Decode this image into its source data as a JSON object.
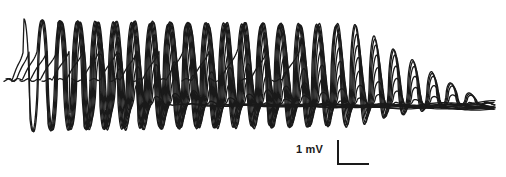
{
  "figure": {
    "type": "electrophysiology-trace-overlay",
    "background_color": "#ffffff",
    "trace_color": "#1a1a1a",
    "width": 506,
    "height": 177
  },
  "scale_bar": {
    "label": "1 mV",
    "vertical_value": 1,
    "vertical_unit": "mV",
    "x": 337,
    "y": 140,
    "vertical_length_px": 25,
    "horizontal_length_px": 32,
    "color": "#1a1a1a"
  },
  "chart_data": {
    "type": "line",
    "title": "",
    "subtitle": "",
    "xlabel": "",
    "ylabel": "",
    "grid": false,
    "legend": false,
    "axes_visible": false,
    "xlim": [
      0,
      506
    ],
    "ylim_pixels": [
      0,
      177
    ],
    "oscillation": {
      "period_px": 19.2,
      "peak_y_px": 20,
      "trough_y_px": 131,
      "baseline_y_px": 80,
      "bundle_y_px": 105,
      "cycles_visible": 18
    },
    "series": [
      {
        "name": "sweep-1",
        "onset_x": 12,
        "burst_start_x": 24,
        "burst_end_x": 60,
        "decay_end_x": 172,
        "amplitude": 1.0,
        "phase": 0.0
      },
      {
        "name": "sweep-2",
        "onset_x": 16,
        "burst_start_x": 30,
        "burst_end_x": 78,
        "decay_end_x": 196,
        "amplitude": 0.99,
        "phase": 0.32
      },
      {
        "name": "sweep-3",
        "onset_x": 22,
        "burst_start_x": 38,
        "burst_end_x": 96,
        "decay_end_x": 220,
        "amplitude": 0.98,
        "phase": 0.64
      },
      {
        "name": "sweep-4",
        "onset_x": 30,
        "burst_start_x": 48,
        "burst_end_x": 116,
        "decay_end_x": 246,
        "amplitude": 0.97,
        "phase": 0.96
      },
      {
        "name": "sweep-5",
        "onset_x": 40,
        "burst_start_x": 58,
        "burst_end_x": 136,
        "decay_end_x": 272,
        "amplitude": 0.97,
        "phase": 1.28
      },
      {
        "name": "sweep-6",
        "onset_x": 52,
        "burst_start_x": 70,
        "burst_end_x": 158,
        "decay_end_x": 300,
        "amplitude": 0.96,
        "phase": 1.6
      },
      {
        "name": "sweep-7",
        "onset_x": 66,
        "burst_start_x": 84,
        "burst_end_x": 180,
        "decay_end_x": 326,
        "amplitude": 0.96,
        "phase": 1.92
      },
      {
        "name": "sweep-8",
        "onset_x": 82,
        "burst_start_x": 100,
        "burst_end_x": 202,
        "decay_end_x": 352,
        "amplitude": 0.95,
        "phase": 2.24
      },
      {
        "name": "sweep-9",
        "onset_x": 100,
        "burst_start_x": 118,
        "burst_end_x": 226,
        "decay_end_x": 378,
        "amplitude": 0.95,
        "phase": 2.56
      },
      {
        "name": "sweep-10",
        "onset_x": 120,
        "burst_start_x": 138,
        "burst_end_x": 250,
        "decay_end_x": 404,
        "amplitude": 0.94,
        "phase": 2.88
      },
      {
        "name": "sweep-11",
        "onset_x": 142,
        "burst_start_x": 160,
        "burst_end_x": 274,
        "decay_end_x": 430,
        "amplitude": 0.94,
        "phase": 3.2
      },
      {
        "name": "sweep-12",
        "onset_x": 166,
        "burst_start_x": 184,
        "burst_end_x": 298,
        "decay_end_x": 456,
        "amplitude": 0.93,
        "phase": 3.52
      },
      {
        "name": "sweep-13",
        "onset_x": 192,
        "burst_start_x": 210,
        "burst_end_x": 320,
        "decay_end_x": 478,
        "amplitude": 0.93,
        "phase": 3.84
      },
      {
        "name": "sweep-14",
        "onset_x": 220,
        "burst_start_x": 238,
        "burst_end_x": 340,
        "decay_end_x": 495,
        "amplitude": 0.92,
        "phase": 4.16
      },
      {
        "name": "sweep-15",
        "onset_x": 250,
        "burst_start_x": 268,
        "burst_end_x": 352,
        "decay_end_x": 495,
        "amplitude": 0.92,
        "phase": 4.48
      },
      {
        "name": "sweep-16",
        "onset_x": 282,
        "burst_start_x": 300,
        "burst_end_x": 356,
        "decay_end_x": 495,
        "amplitude": 0.91,
        "phase": 4.8
      }
    ]
  }
}
